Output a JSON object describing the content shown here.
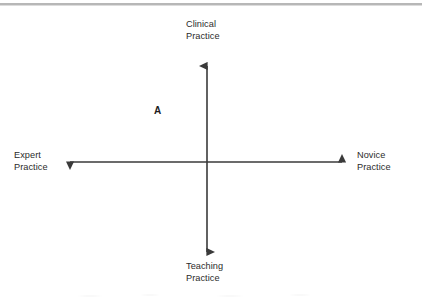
{
  "figure": {
    "type": "quadrant-axes-diagram",
    "background_color": "#ffffff",
    "axis_color": "#3a3a3a",
    "text_color": "#2b2b2b",
    "top_rule_color": "#b7b7b7"
  },
  "axes": {
    "origin": {
      "x": 207,
      "y": 162
    },
    "vertical": {
      "name": "clinical-teaching-axis",
      "orientation": "vertical",
      "double_headed": true,
      "from_y": 62,
      "to_y": 256,
      "positive_end_label": "Clinical\nPractice",
      "negative_end_label": "Teaching\nPractice"
    },
    "horizontal": {
      "name": "expert-novice-axis",
      "orientation": "horizontal",
      "double_headed": true,
      "from_x": 65,
      "to_x": 347,
      "positive_end_label": "Novice\nPractice",
      "negative_end_label": "Expert\nPractice"
    }
  },
  "labels": {
    "top": {
      "line1": "Clinical",
      "line2": "Practice"
    },
    "bottom": {
      "line1": "Teaching",
      "line2": "Practice"
    },
    "left": {
      "line1": "Expert",
      "line2": "Practice"
    },
    "right": {
      "line1": "Novice",
      "line2": "Practice"
    }
  },
  "markers": [
    {
      "label": "A",
      "quadrant": "upper-left",
      "x": 157,
      "y": 112,
      "description": "clinical practice / expert practice quadrant"
    }
  ]
}
